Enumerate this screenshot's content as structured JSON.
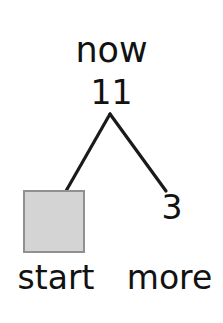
{
  "diagram": {
    "type": "binary-tree-fragment",
    "background_color": "#ffffff",
    "line_color": "#1a1a1a",
    "text_color": "#121212",
    "root": {
      "header_label": "now",
      "value": "11"
    },
    "branches": [
      {
        "side": "left",
        "child_type": "box",
        "child_label": "start",
        "child_value": ""
      },
      {
        "side": "right",
        "child_type": "value",
        "child_label": "more",
        "child_value": "3"
      }
    ],
    "box_node": {
      "name": "start",
      "fill_color": "#d4d4d4",
      "border_color": "#909090"
    }
  }
}
